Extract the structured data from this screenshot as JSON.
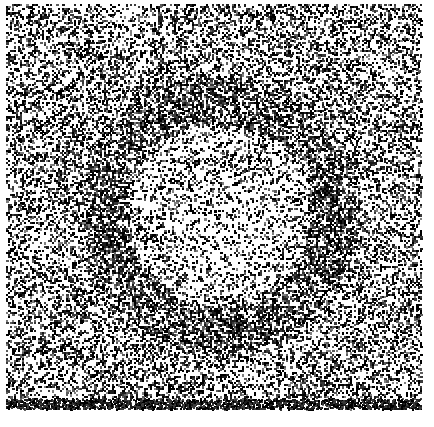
{
  "image": {
    "title": "Random dot pattern with circular disc",
    "width": 434,
    "height": 427,
    "background_color": "#ffffff",
    "dot_color": "#1a1a1a",
    "kind": "random-dot-texture"
  },
  "noise_field": {
    "name": "random-dot-field",
    "left": 6,
    "top": 4,
    "right": 421,
    "bottom": 409,
    "background_density": 0.38,
    "dot_size_px": 2,
    "gray_levels": [
      "#000000",
      "#1c1c1c",
      "#3a3a3a",
      "#5c5c5c",
      "#808080"
    ]
  },
  "disc": {
    "name": "circular-disc",
    "center_x": 218,
    "center_y": 214,
    "inner_radius": 93,
    "outer_radius": 131,
    "interior_density": 0.26,
    "ring_density": 0.66,
    "ring_falloff": 0.35
  },
  "edge_margins": {
    "left_px": 6,
    "top_px": 4,
    "right_px": 13,
    "bottom_px": 18
  },
  "chart_data": {
    "type": "heatmap",
    "xlabel": "",
    "ylabel": "",
    "regions": [
      "background",
      "ring",
      "interior"
    ],
    "values": [
      0.38,
      0.66,
      0.26
    ],
    "x": [
      218,
      218,
      218
    ],
    "y": [
      214,
      214,
      214
    ],
    "legend_position": "none",
    "grid": false
  }
}
